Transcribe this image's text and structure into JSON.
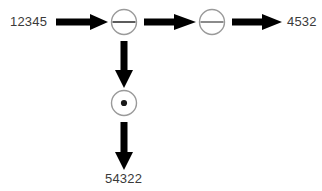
{
  "diagram": {
    "type": "flow-diagram",
    "background_color": "#ffffff",
    "arrow_color": "#000000",
    "circle_stroke_color": "#9a9a9a",
    "label_color": "#3a3a3a",
    "labels": {
      "input": "12345",
      "output_right": "4532",
      "output_bottom": "54322"
    },
    "nodes": [
      {
        "id": "node-minus-1",
        "symbol": "minus",
        "symbol_name": "circle-minus-icon",
        "x": 124,
        "y": 22,
        "radius": 13
      },
      {
        "id": "node-minus-2",
        "symbol": "minus",
        "symbol_name": "circle-minus-icon",
        "x": 212,
        "y": 22,
        "radius": 13
      },
      {
        "id": "node-dot",
        "symbol": "dot",
        "symbol_name": "circle-dot-icon",
        "x": 124,
        "y": 103,
        "radius": 13
      }
    ],
    "arrows": [
      {
        "id": "arrow-input-to-minus1",
        "direction": "right",
        "from": "12345",
        "to": "node-minus-1"
      },
      {
        "id": "arrow-minus1-to-minus2",
        "direction": "right",
        "from": "node-minus-1",
        "to": "node-minus-2"
      },
      {
        "id": "arrow-minus2-to-output",
        "direction": "right",
        "from": "node-minus-2",
        "to": "4532"
      },
      {
        "id": "arrow-minus1-to-dot",
        "direction": "down",
        "from": "node-minus-1",
        "to": "node-dot"
      },
      {
        "id": "arrow-dot-to-output",
        "direction": "down",
        "from": "node-dot",
        "to": "54322"
      }
    ]
  }
}
